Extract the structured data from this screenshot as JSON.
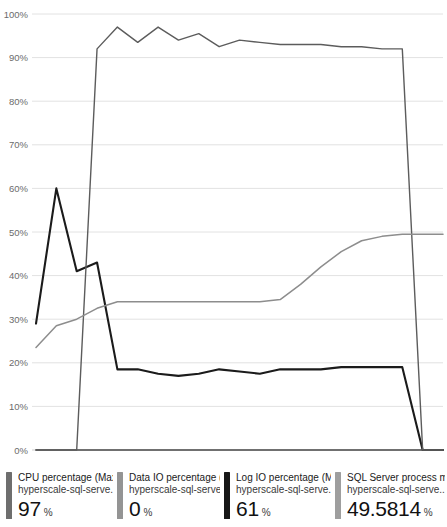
{
  "chart_data": {
    "type": "line",
    "title": "",
    "xlabel": "",
    "ylabel": "",
    "ylim": [
      0,
      100
    ],
    "grid": true,
    "legend_position": "bottom",
    "ytick_labels": [
      "100%",
      "90%",
      "80%",
      "70%",
      "60%",
      "50%",
      "40%",
      "30%",
      "20%",
      "10%",
      "0%"
    ],
    "ytick_values": [
      100,
      90,
      80,
      70,
      60,
      50,
      40,
      30,
      20,
      10,
      0
    ],
    "x": [
      0,
      1,
      2,
      3,
      4,
      5,
      6,
      7,
      8,
      9,
      10,
      11,
      12,
      13,
      14,
      15,
      16,
      17,
      18,
      19,
      20
    ],
    "series": [
      {
        "name": "CPU percentage (Max)",
        "color": "#1b1b1b",
        "width": 2.1,
        "values": [
          29,
          60,
          41,
          43,
          18.5,
          18.5,
          17.5,
          17,
          17.5,
          18.5,
          18,
          17.5,
          18.5,
          18.5,
          18.5,
          19,
          19,
          19,
          19,
          0,
          0
        ]
      },
      {
        "name": "Data IO percentage (Max)",
        "color": "#4a4a4a",
        "width": 1.6,
        "values": [
          0,
          0,
          0,
          0,
          0,
          0,
          0,
          0,
          0,
          0,
          0,
          0,
          0,
          0,
          0,
          0,
          0,
          0,
          0,
          0,
          0
        ]
      },
      {
        "name": "Log IO percentage (Max)",
        "color": "#5c5c5c",
        "width": 1.4,
        "values": [
          0,
          0,
          0,
          92,
          97,
          93.5,
          97,
          94,
          95.5,
          92.5,
          94,
          93.5,
          93,
          93,
          93,
          92.5,
          92.5,
          92,
          92,
          0,
          0
        ]
      },
      {
        "name": "SQL Server process memory percent (Avg)",
        "color": "#8d8d8d",
        "width": 1.5,
        "values": [
          23.5,
          28.5,
          30,
          32.5,
          34,
          34,
          34,
          34,
          34,
          34,
          34,
          34,
          34.5,
          38,
          42,
          45.5,
          48,
          49,
          49.5,
          49.5,
          49.5
        ]
      }
    ]
  },
  "legend": {
    "items": [
      {
        "color": "#6e6e6e",
        "metric": "CPU percentage (Max)",
        "resource": "hyperscale-sql-serve...",
        "value": "97",
        "unit": "%",
        "icon": "legend-swatch-icon"
      },
      {
        "color": "#949494",
        "metric": "Data IO percentage (...",
        "resource": "hyperscale-sql-serve..",
        "value": "0",
        "unit": "%",
        "icon": "legend-swatch-icon"
      },
      {
        "color": "#171717",
        "metric": "Log IO percentage (Max)",
        "resource": "hyperscale-sql-serve...",
        "value": "61",
        "unit": "%",
        "icon": "legend-swatch-icon"
      },
      {
        "color": "#9e9e9e",
        "metric": "SQL Server process m...",
        "resource": "hyperscale-sql-serve...",
        "value": "49.5814",
        "unit": "%",
        "icon": "legend-swatch-icon"
      }
    ]
  },
  "axis": {
    "grid_color": "#e2e2e2",
    "baseline_color": "#cfcfcf",
    "label_color": "#6b6b6b"
  }
}
